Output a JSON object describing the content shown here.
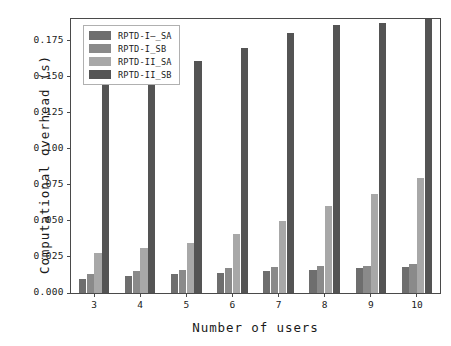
{
  "chart_data": {
    "type": "bar",
    "title": "",
    "xlabel": "Number of users",
    "ylabel": "Computational overhead (s)",
    "categories": [
      "3",
      "4",
      "5",
      "6",
      "7",
      "8",
      "9",
      "10"
    ],
    "ylim": [
      0.0,
      0.19
    ],
    "yticks": [
      "0.000",
      "0.025",
      "0.050",
      "0.075",
      "0.100",
      "0.125",
      "0.150",
      "0.175"
    ],
    "ytick_values": [
      0.0,
      0.025,
      0.05,
      0.075,
      0.1,
      0.125,
      0.15,
      0.175
    ],
    "grid": false,
    "legend_position": "upper-left",
    "series": [
      {
        "name": "RPTD-I—_SA",
        "color": "#6e6e6e",
        "values": [
          0.01,
          0.012,
          0.013,
          0.014,
          0.015,
          0.016,
          0.017,
          0.018
        ]
      },
      {
        "name": "RPTD-I_SB",
        "color": "#8a8a8a",
        "values": [
          0.013,
          0.015,
          0.016,
          0.017,
          0.018,
          0.019,
          0.019,
          0.02
        ]
      },
      {
        "name": "RPTD-II_SA",
        "color": "#a8a8a8",
        "values": [
          0.028,
          0.031,
          0.035,
          0.041,
          0.05,
          0.06,
          0.069,
          0.08
        ]
      },
      {
        "name": "RPTD-II_SB",
        "color": "#545454",
        "values": [
          0.15,
          0.152,
          0.161,
          0.17,
          0.18,
          0.186,
          0.187,
          0.19
        ]
      }
    ]
  },
  "axis": {
    "frame_color": "#4a4a4a",
    "text_color": "#1a1a1a"
  }
}
